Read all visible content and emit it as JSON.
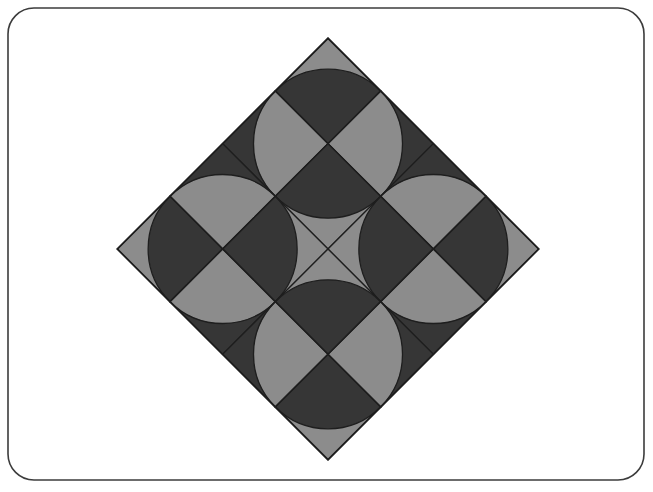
{
  "page": {
    "width": 653,
    "height": 492,
    "background_color": "#ffffff"
  },
  "frame": {
    "name": "rounded-rectangle-border",
    "x": 8,
    "y": 8,
    "width": 636,
    "height": 472,
    "corner_radius": 26,
    "stroke_color": "#3c3c3c",
    "stroke_width": 1.6,
    "fill": "none"
  },
  "chart_data": {
    "type": "diagram",
    "title": "",
    "subtitle": "",
    "xlabel": "",
    "ylabel": "",
    "pattern_name": "rotated quarter-circle tile quilt",
    "grid": {
      "rows": 4,
      "cols": 4,
      "tile_size": 74.5,
      "rotation_degrees": 45,
      "center_x": 328,
      "center_y": 249
    },
    "diamond_vertices": {
      "top": [
        322,
        31
      ],
      "right": [
        538,
        248
      ],
      "bottom": [
        322,
        466
      ],
      "left": [
        118,
        250
      ]
    },
    "colors": {
      "dark": "#363636",
      "light": "#8c8c8c",
      "line": "#1e1e1e",
      "background": "#ffffff"
    },
    "stroke_width": 1.3,
    "legend": [
      {
        "label": "dark field",
        "color": "#363636"
      },
      {
        "label": "light field",
        "color": "#8c8c8c"
      }
    ],
    "tiles": [
      {
        "row": 0,
        "col": 0,
        "base": "light",
        "arc_corner": "br",
        "arc_fill": "dark"
      },
      {
        "row": 0,
        "col": 1,
        "base": "dark",
        "arc_corner": "bl",
        "arc_fill": "light"
      },
      {
        "row": 0,
        "col": 2,
        "base": "dark",
        "arc_corner": "br",
        "arc_fill": "light"
      },
      {
        "row": 0,
        "col": 3,
        "base": "light",
        "arc_corner": "bl",
        "arc_fill": "dark"
      },
      {
        "row": 1,
        "col": 0,
        "base": "dark",
        "arc_corner": "tr",
        "arc_fill": "light"
      },
      {
        "row": 1,
        "col": 1,
        "base": "light",
        "arc_corner": "tl",
        "arc_fill": "dark"
      },
      {
        "row": 1,
        "col": 2,
        "base": "light",
        "arc_corner": "tr",
        "arc_fill": "dark"
      },
      {
        "row": 1,
        "col": 3,
        "base": "dark",
        "arc_corner": "tl",
        "arc_fill": "light"
      },
      {
        "row": 2,
        "col": 0,
        "base": "dark",
        "arc_corner": "br",
        "arc_fill": "light"
      },
      {
        "row": 2,
        "col": 1,
        "base": "light",
        "arc_corner": "bl",
        "arc_fill": "dark"
      },
      {
        "row": 2,
        "col": 2,
        "base": "light",
        "arc_corner": "br",
        "arc_fill": "dark"
      },
      {
        "row": 2,
        "col": 3,
        "base": "dark",
        "arc_corner": "bl",
        "arc_fill": "light"
      },
      {
        "row": 3,
        "col": 0,
        "base": "light",
        "arc_corner": "tr",
        "arc_fill": "dark"
      },
      {
        "row": 3,
        "col": 1,
        "base": "dark",
        "arc_corner": "tl",
        "arc_fill": "light"
      },
      {
        "row": 3,
        "col": 2,
        "base": "dark",
        "arc_corner": "tr",
        "arc_fill": "light"
      },
      {
        "row": 3,
        "col": 3,
        "base": "light",
        "arc_corner": "tl",
        "arc_fill": "dark"
      }
    ]
  }
}
